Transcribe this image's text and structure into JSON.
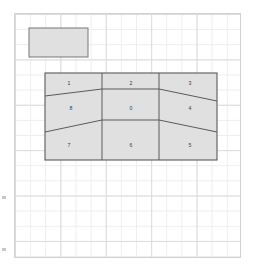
{
  "canvas": {
    "width": 255,
    "height": 271,
    "background_color": "#ffffff",
    "grid": {
      "minor_line_color": "#ededed",
      "major_line_color": "#dcdcdc",
      "minor_spacing_px": 15,
      "major_spacing_px": 45,
      "border_color": "#d2d2d2"
    }
  },
  "margin_ticks": [
    {
      "name": "left-tick-upper",
      "x": 2,
      "y": 196
    },
    {
      "name": "left-tick-lower",
      "x": 2,
      "y": 248
    }
  ],
  "legend_box": {
    "label": "",
    "fill_color": "#e0e0e0",
    "stroke_color": "#808080",
    "x": 29,
    "y": 28,
    "width": 59,
    "height": 29
  },
  "diagram": {
    "title": "",
    "fill_color": "#e0e0e0",
    "stroke_color": "#5a5a5a",
    "outline": {
      "x": 45,
      "y": 73,
      "width": 172,
      "height": 87
    },
    "columns": [
      {
        "name": "left-column",
        "x_start": 45,
        "x_end": 102
      },
      {
        "name": "center-column",
        "x_start": 102,
        "x_end": 159
      },
      {
        "name": "right-column",
        "x_start": 159,
        "x_end": 217
      }
    ],
    "cells": [
      {
        "id": "cell-1",
        "label": "1",
        "row": "top",
        "column": "left",
        "cx": 69,
        "cy": 83
      },
      {
        "id": "cell-2",
        "label": "2",
        "row": "top",
        "column": "center",
        "cx": 131,
        "cy": 83
      },
      {
        "id": "cell-3",
        "label": "3",
        "row": "top",
        "column": "right",
        "cx": 190,
        "cy": 83
      },
      {
        "id": "cell-8",
        "label": "8",
        "row": "middle",
        "column": "left",
        "cx": 71,
        "cy": 108
      },
      {
        "id": "cell-0",
        "label": "0",
        "row": "middle",
        "column": "center",
        "cx": 131,
        "cy": 108
      },
      {
        "id": "cell-4",
        "label": "4",
        "row": "middle",
        "column": "right",
        "cx": 190,
        "cy": 108
      },
      {
        "id": "cell-7",
        "label": "7",
        "row": "bottom",
        "column": "left",
        "cx": 69,
        "cy": 145
      },
      {
        "id": "cell-6",
        "label": "6",
        "row": "bottom",
        "column": "center",
        "cx": 131,
        "cy": 145
      },
      {
        "id": "cell-5",
        "label": "5",
        "row": "bottom",
        "column": "right",
        "cx": 190,
        "cy": 145
      }
    ]
  }
}
